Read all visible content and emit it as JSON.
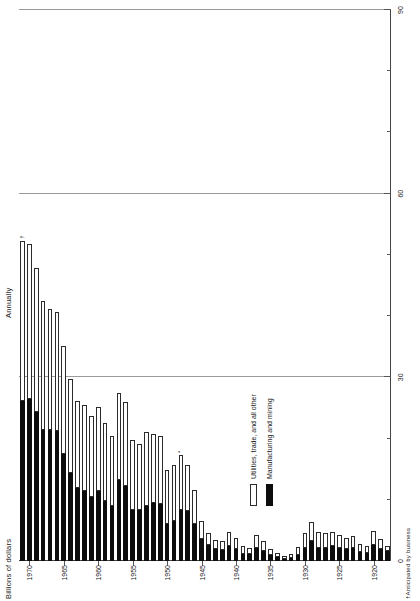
{
  "chart_data": {
    "type": "bar",
    "orientation": "vertical-rotated",
    "title": "Billions of dollars",
    "subtitle": "Annually",
    "ylabel": "Billions of dollars",
    "xlabel": "",
    "ylim": [
      0,
      90
    ],
    "yticks": [
      0,
      30,
      60,
      90
    ],
    "ytick_labels": [
      "0",
      "30",
      "60",
      "90"
    ],
    "grid": "vertical gridlines at 30, 60, 90",
    "legend_position": "upper-left",
    "footnote": "†Anticipated by business",
    "xtick_labels": [
      "1920",
      "1925",
      "1930",
      "1935",
      "1940",
      "1945",
      "1950",
      "1955",
      "1960",
      "1965",
      "1970"
    ],
    "categories": [
      "1918",
      "1919",
      "1920",
      "1921",
      "1922",
      "1923",
      "1924",
      "1925",
      "1926",
      "1927",
      "1928",
      "1929",
      "1930",
      "1931",
      "1932",
      "1933",
      "1934",
      "1935",
      "1936",
      "1937",
      "1938",
      "1939",
      "1940",
      "1941",
      "1942",
      "1943",
      "1944",
      "1945",
      "1946",
      "1947",
      "1948",
      "1949",
      "1950",
      "1951",
      "1952",
      "1953",
      "1954",
      "1955",
      "1956",
      "1957",
      "1958",
      "1959",
      "1960",
      "1961",
      "1962",
      "1963",
      "1964",
      "1965",
      "1966",
      "1967",
      "1968",
      "1969",
      "1970",
      "1971"
    ],
    "series": [
      {
        "name": "Manufacturing and mining",
        "color": "#0d0d0d",
        "values": [
          1.6,
          2.0,
          2.6,
          1.3,
          1.4,
          2.2,
          1.9,
          2.1,
          2.4,
          2.2,
          2.2,
          3.2,
          2.1,
          1.0,
          0.5,
          0.4,
          0.6,
          0.9,
          1.6,
          2.2,
          1.1,
          1.2,
          1.9,
          2.5,
          1.8,
          2.0,
          2.6,
          3.6,
          6.1,
          8.2,
          8.3,
          6.5,
          6.0,
          9.3,
          9.4,
          9.0,
          8.4,
          8.4,
          12.3,
          13.2,
          9.0,
          9.8,
          11.4,
          10.4,
          11.4,
          11.9,
          14.3,
          17.5,
          21.3,
          21.4,
          21.4,
          24.3,
          26.4,
          26.1
        ]
      },
      {
        "name": "Utilities, trade, and all other",
        "color": "#ffffff",
        "values": [
          0.9,
          1.6,
          2.3,
          1.2,
          1.3,
          1.9,
          1.8,
          2.2,
          2.4,
          2.3,
          2.5,
          3.2,
          2.4,
          1.3,
          0.6,
          0.5,
          0.7,
          1.0,
          1.6,
          2.0,
          1.1,
          1.3,
          1.8,
          2.2,
          1.5,
          1.4,
          1.9,
          3.0,
          5.5,
          7.5,
          9.0,
          9.2,
          8.8,
          11.1,
          11.4,
          12.1,
          10.7,
          11.3,
          13.7,
          14.3,
          11.4,
          12.7,
          13.7,
          13.3,
          14.1,
          14.3,
          15.5,
          17.6,
          19.3,
          19.8,
          21.0,
          23.5,
          25.3,
          26.2
        ]
      }
    ],
    "totals": [
      2.5,
      3.6,
      4.9,
      2.5,
      2.7,
      4.1,
      3.7,
      4.3,
      4.8,
      4.5,
      4.7,
      6.4,
      4.5,
      2.3,
      1.1,
      0.9,
      1.3,
      1.9,
      3.2,
      4.2,
      2.2,
      2.5,
      3.7,
      4.7,
      3.3,
      3.4,
      4.5,
      6.6,
      11.6,
      15.7,
      17.3,
      15.7,
      14.8,
      20.4,
      20.8,
      21.1,
      19.1,
      19.7,
      26.0,
      27.5,
      20.4,
      22.5,
      25.1,
      23.7,
      25.5,
      26.2,
      29.8,
      35.1,
      40.6,
      41.2,
      42.4,
      47.8,
      51.7,
      52.3
    ],
    "markers": [
      {
        "category": "1948",
        "symbol": "*"
      },
      {
        "category": "1971",
        "symbol": "†"
      }
    ],
    "annotations": {
      "anticipated_year": "1971",
      "anticipated_symbol": "†"
    }
  },
  "labels": {
    "billions": "Billions of dollars",
    "annually": "Annually",
    "footnote": "†Anticipated by business",
    "legend": [
      {
        "key": "light",
        "text": "Utilities, trade, and all other"
      },
      {
        "key": "dark",
        "text": "Manufacturing and mining"
      }
    ]
  },
  "colors": {
    "dark": "#0d0d0d",
    "light": "#ffffff",
    "outline": "#2b2b2b",
    "axis": "#444444",
    "grid": "#9a9a9a"
  }
}
